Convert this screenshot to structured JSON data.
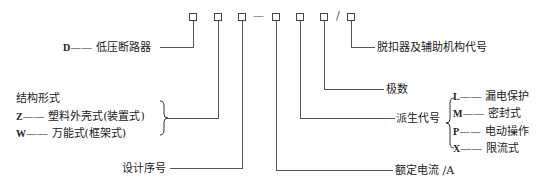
{
  "model_code": {
    "boxes": [
      "□",
      "□",
      "□",
      "□",
      "□",
      "□",
      "□"
    ],
    "dash": "—",
    "slash": "/"
  },
  "labels": {
    "type": {
      "code": "D",
      "dash": "——",
      "text": "低压断路器"
    },
    "structure": {
      "title": "结构形式",
      "options": [
        {
          "code": "Z",
          "dash": "——",
          "text": "塑料外壳式(装置式)"
        },
        {
          "code": "W",
          "dash": "——",
          "text": "万能式(框架式)"
        }
      ]
    },
    "design_no": "设计序号",
    "rated_current": "额定电流 /A",
    "derived_code": {
      "title": "派生代号",
      "options": [
        {
          "code": "L",
          "dash": "——",
          "text": "漏电保护"
        },
        {
          "code": "M",
          "dash": "——",
          "text": "密封式"
        },
        {
          "code": "P",
          "dash": "——",
          "text": "电动操作"
        },
        {
          "code": "X",
          "dash": "——",
          "text": "限流式"
        }
      ]
    },
    "poles": "极数",
    "release_code": "脱扣器及辅助机构代号"
  }
}
